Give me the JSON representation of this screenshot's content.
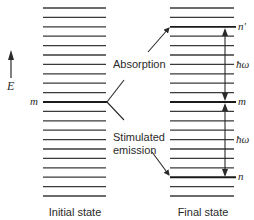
{
  "diagram": {
    "axis_label": "E",
    "left_ladder": {
      "caption": "Initial state",
      "level_label": "m"
    },
    "right_ladder": {
      "caption": "Final state",
      "labels": {
        "upper": "n'",
        "middle": "m",
        "lower": "n"
      },
      "gap_upper_label": "ħω",
      "gap_lower_label": "ħω"
    },
    "process_labels": {
      "absorption": "Absorption",
      "stimulated_line1": "Stimulated",
      "stimulated_line2": "emission"
    },
    "colors": {
      "line": "#2a2a2a",
      "background": "#ffffff"
    }
  }
}
